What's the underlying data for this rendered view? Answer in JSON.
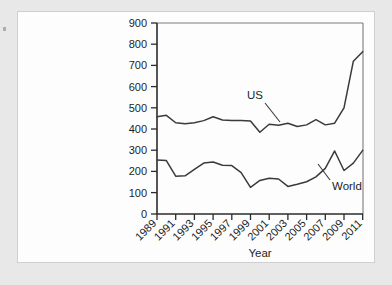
{
  "chart_data": {
    "type": "line",
    "title": "",
    "xlabel": "Year",
    "ylabel": "",
    "xlim": [
      1989,
      2011
    ],
    "ylim": [
      0,
      900
    ],
    "grid": false,
    "legend_position": "inline-annotations",
    "x": [
      1989,
      1990,
      1991,
      1992,
      1993,
      1994,
      1995,
      1996,
      1997,
      1998,
      1999,
      2000,
      2001,
      2002,
      2003,
      2004,
      2005,
      2006,
      2007,
      2008,
      2009,
      2010,
      2011
    ],
    "xtick_labels": [
      "1989",
      "1991",
      "1993",
      "1995",
      "1997",
      "1999",
      "2001",
      "2003",
      "2005",
      "2007",
      "2009",
      "2011"
    ],
    "ytick_labels": [
      "0",
      "100",
      "200",
      "300",
      "400",
      "500",
      "600",
      "700",
      "800",
      "900"
    ],
    "series": [
      {
        "name": "US",
        "values": [
          458,
          465,
          430,
          425,
          430,
          440,
          458,
          443,
          440,
          440,
          438,
          385,
          423,
          418,
          428,
          412,
          420,
          445,
          420,
          428,
          500,
          720,
          765
        ]
      },
      {
        "name": "World",
        "values": [
          255,
          252,
          178,
          180,
          210,
          240,
          245,
          230,
          228,
          195,
          125,
          158,
          168,
          165,
          130,
          140,
          152,
          175,
          215,
          297,
          205,
          240,
          300
        ]
      }
    ],
    "annotations": [
      {
        "text": "US",
        "x": 2000.6,
        "y": 560
      },
      {
        "text": "World",
        "x": 2007.3,
        "y": 130
      }
    ]
  },
  "annotations": {
    "us_label": "US",
    "world_label": "World"
  },
  "axes": {
    "x_title": "Year",
    "y_ticks": [
      "900",
      "800",
      "700",
      "600",
      "500",
      "400",
      "300",
      "200",
      "100",
      "0"
    ],
    "x_ticks": [
      "1989",
      "1991",
      "1993",
      "1995",
      "1997",
      "1999",
      "2001",
      "2003",
      "2005",
      "2007",
      "2009",
      "2011"
    ]
  }
}
